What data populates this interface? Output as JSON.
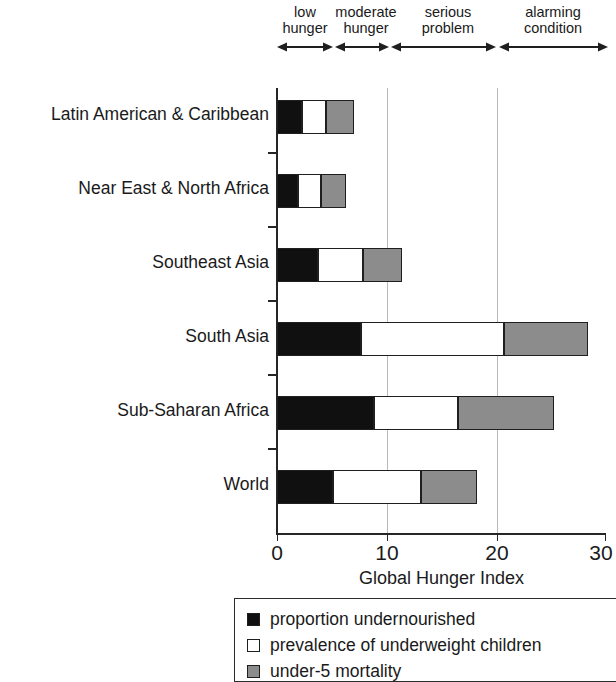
{
  "chart_data": {
    "type": "bar",
    "orientation": "horizontal",
    "stacked": true,
    "title": "",
    "xlabel": "Global Hunger Index",
    "ylabel": "",
    "xlim": [
      0,
      30
    ],
    "xticks": [
      0,
      10,
      20,
      30
    ],
    "xtick_labels": [
      "0",
      "10",
      "20",
      "30"
    ],
    "grid": "vertical gridlines at 10 and 20",
    "legend_position": "below plot",
    "categories": [
      "Latin American & Caribbean",
      "Near East & North Africa",
      "Southeast Asia",
      "South Asia",
      "Sub-Saharan Africa",
      "World"
    ],
    "series": [
      {
        "name": "proportion undernourished",
        "color": "#101010",
        "values": [
          2.3,
          1.9,
          3.7,
          7.7,
          8.8,
          5.1
        ]
      },
      {
        "name": "prevalence of underweight children",
        "color": "#ffffff",
        "values": [
          2.2,
          2.1,
          4.1,
          13.0,
          7.7,
          8.0
        ]
      },
      {
        "name": "under-5 mortality",
        "color": "#8c8c8c",
        "values": [
          2.5,
          2.3,
          3.6,
          7.7,
          8.8,
          5.1
        ]
      }
    ],
    "totals": [
      7.0,
      6.3,
      11.4,
      28.4,
      25.3,
      18.2
    ],
    "severity_bands": [
      {
        "label": "low\nhunger",
        "start": 0,
        "end": 4.85
      },
      {
        "label": "moderate\nhunger",
        "start": 5,
        "end": 9.9
      },
      {
        "label": "serious\nproblem",
        "start": 10,
        "end": 19.9
      },
      {
        "label": "alarming\ncondition",
        "start": 20,
        "end": 30
      }
    ]
  },
  "axis": {
    "x_title": "Global Hunger Index",
    "tick_labels": [
      "0",
      "10",
      "20",
      "30"
    ]
  },
  "bands": [
    {
      "label": "low\nhunger"
    },
    {
      "label": "moderate\nhunger"
    },
    {
      "label": "serious\nproblem"
    },
    {
      "label": "alarming\ncondition"
    }
  ],
  "categories": [
    "Latin American & Caribbean",
    "Near East & North Africa",
    "Southeast Asia",
    "South Asia",
    "Sub-Saharan Africa",
    "World"
  ],
  "legend": {
    "items": [
      {
        "label": "proportion undernourished",
        "swatch": "black"
      },
      {
        "label": "prevalence of underweight children",
        "swatch": "white"
      },
      {
        "label": "under-5 mortality",
        "swatch": "gray"
      }
    ]
  }
}
